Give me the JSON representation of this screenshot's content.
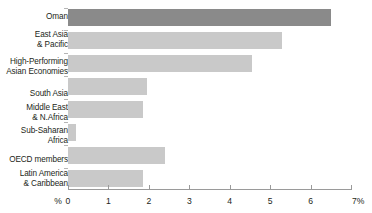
{
  "chart_data": {
    "type": "bar",
    "orientation": "horizontal",
    "title": "",
    "subtitle": "",
    "xlabel": "",
    "ylabel": "",
    "xlim": [
      0,
      7
    ],
    "xticks": [
      0,
      1,
      2,
      3,
      4,
      5,
      6,
      7
    ],
    "xtick_labels": [
      "0",
      "1",
      "2",
      "3",
      "4",
      "5",
      "6",
      "7"
    ],
    "axis_prefix_label": "%",
    "axis_suffix_label": "7%",
    "grid": false,
    "legend": null,
    "categories": [
      "Oman",
      "East Asia\n& Pacific",
      "High-Performing\nAsian Economies",
      "South Asia",
      "Middle East\n& N.Africa",
      "Sub-Saharan\nAfrica",
      "OECD members",
      "Latin America\n& Caribbean"
    ],
    "values": [
      6.5,
      5.3,
      4.55,
      1.95,
      1.85,
      0.2,
      2.4,
      1.85
    ],
    "highlight_index": 0,
    "colors": {
      "bar": "#c9c9c9",
      "bar_highlight": "#8a8a8a",
      "axis": "#9a9a9a",
      "text": "#231f20",
      "background": "#ffffff"
    }
  }
}
